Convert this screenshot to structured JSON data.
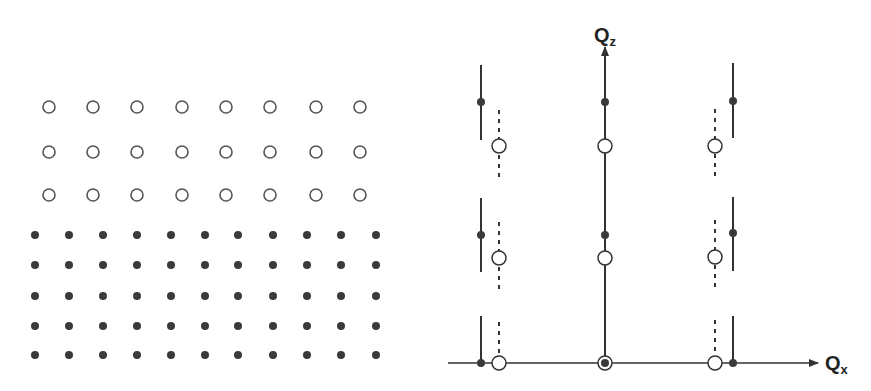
{
  "colors": {
    "open_stroke": "#555555",
    "filled": "#3a3a3a",
    "line": "#333333",
    "background": "#ffffff"
  },
  "real_space": {
    "open_lattice": {
      "columns_x": [
        49,
        93,
        137,
        182,
        226,
        270,
        316,
        360
      ],
      "rows_y": [
        107,
        152,
        195
      ],
      "radius": 6
    },
    "filled_lattice": {
      "columns_x": [
        35,
        69,
        103,
        137,
        171,
        205,
        238,
        273,
        307,
        341,
        376
      ],
      "rows_y": [
        235,
        265,
        296,
        326,
        355
      ],
      "radius": 4
    }
  },
  "reciprocal_space": {
    "axes": {
      "origin": [
        605,
        363
      ],
      "qx_axis": {
        "x_start": 448,
        "x_end": 818,
        "label": "Q",
        "subscript": "x"
      },
      "qz_axis": {
        "y_start": 363,
        "y_end": 47,
        "label": "Q",
        "subscript": "z"
      }
    },
    "solid_rods": [
      {
        "x": 481,
        "segments": [
          [
            65,
            140
          ],
          [
            198,
            272
          ],
          [
            316,
            363
          ]
        ],
        "dots_y": [
          102,
          235,
          363
        ]
      },
      {
        "x": 605,
        "segments": [
          [
            52,
            363
          ]
        ],
        "dots_y": [
          102,
          235,
          363
        ]
      },
      {
        "x": 733,
        "segments": [
          [
            63,
            138
          ],
          [
            197,
            271
          ],
          [
            316,
            363
          ]
        ],
        "dots_y": [
          101,
          233,
          363
        ]
      }
    ],
    "dashed_rods": [
      {
        "x": 499,
        "segments": [
          [
            110,
            182
          ],
          [
            222,
            294
          ],
          [
            322,
            357
          ]
        ],
        "circles_y": [
          146,
          258,
          363
        ]
      },
      {
        "x": 605,
        "segments": [
          [
            152,
            225
          ],
          [
            265,
            356
          ]
        ],
        "circles_y": [
          146,
          258,
          363
        ]
      },
      {
        "x": 715,
        "segments": [
          [
            109,
            181
          ],
          [
            220,
            292
          ],
          [
            320,
            357
          ]
        ],
        "circles_y": [
          146,
          257,
          363
        ]
      }
    ],
    "circle_radius": 7,
    "dot_radius": 4
  }
}
